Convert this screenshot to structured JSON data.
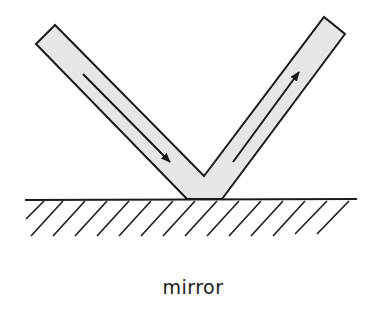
{
  "diagram": {
    "label": "mirror",
    "colors": {
      "stroke": "#1a1a1a",
      "beam_fill": "#e6e6e6",
      "background": "#ffffff"
    },
    "elements": {
      "incident_beam": {
        "direction": "down-right",
        "arrow_from": [
          83,
          74
        ],
        "arrow_to": [
          171,
          163
        ]
      },
      "reflected_beam": {
        "direction": "up-right",
        "arrow_from": [
          233,
          162
        ],
        "arrow_to": [
          300,
          71
        ]
      },
      "mirror_surface": {
        "y": 200,
        "x_start": 25,
        "x_end": 357,
        "hatching": "diagonal"
      }
    }
  }
}
